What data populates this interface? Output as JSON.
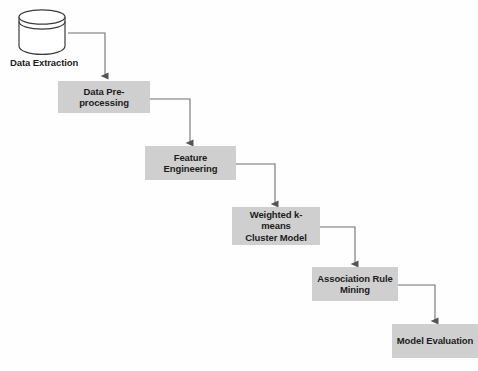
{
  "diagram": {
    "background_color": "#fefefe",
    "node_fill_color": "#cfcfcf",
    "line_color": "#6f6f6f",
    "text_color": "#1c1c1c",
    "source": {
      "icon": "database-cylinder-icon",
      "label": "Data Extraction"
    },
    "nodes": [
      {
        "id": "data-pre-processing",
        "label": "Data Pre-processing"
      },
      {
        "id": "feature-engineering",
        "label": "Feature Engineering"
      },
      {
        "id": "weighted-k-means-cluster-model",
        "label": "Weighted k-means\nCluster Model"
      },
      {
        "id": "association-rule-mining",
        "label": "Association Rule\nMining"
      },
      {
        "id": "model-evaluation",
        "label": "Model Evaluation"
      }
    ],
    "edges": [
      {
        "from": "Data Extraction",
        "to": "Data Pre-processing"
      },
      {
        "from": "Data Pre-processing",
        "to": "Feature Engineering"
      },
      {
        "from": "Feature Engineering",
        "to": "Weighted k-means Cluster Model"
      },
      {
        "from": "Weighted k-means Cluster Model",
        "to": "Association Rule Mining"
      },
      {
        "from": "Association Rule Mining",
        "to": "Model Evaluation"
      }
    ]
  }
}
